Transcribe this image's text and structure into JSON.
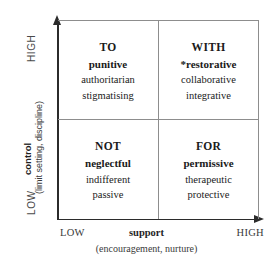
{
  "chart_data": {
    "type": "table",
    "xlabel": "support",
    "xlabel_note": "(encouragement, nurture)",
    "ylabel": "control",
    "ylabel_note": "(limit setting, discipline)",
    "x_ticks": [
      "LOW",
      "HIGH"
    ],
    "y_ticks": [
      "LOW",
      "HIGH"
    ],
    "axis_low": "LOW",
    "axis_high": "HIGH",
    "grid": true,
    "legend": "none",
    "quadrants": [
      {
        "id": "to",
        "position": "top-left",
        "control": "HIGH",
        "support": "LOW",
        "heading": "TO",
        "subheading": "punitive",
        "items": [
          "authoritarian",
          "stigmatising"
        ]
      },
      {
        "id": "with",
        "position": "top-right",
        "control": "HIGH",
        "support": "HIGH",
        "heading": "WITH",
        "subheading": "*restorative",
        "items": [
          "collaborative",
          "integrative"
        ]
      },
      {
        "id": "not",
        "position": "bottom-left",
        "control": "LOW",
        "support": "LOW",
        "heading": "NOT",
        "subheading": "neglectful",
        "items": [
          "indifferent",
          "passive"
        ]
      },
      {
        "id": "for",
        "position": "bottom-right",
        "control": "LOW",
        "support": "HIGH",
        "heading": "FOR",
        "subheading": "permissive",
        "items": [
          "therapeutic",
          "protective"
        ]
      }
    ]
  }
}
